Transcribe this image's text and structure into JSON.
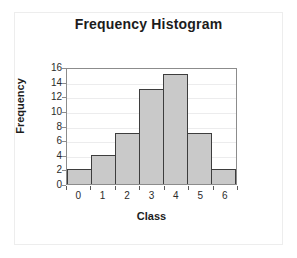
{
  "chart_data": {
    "type": "bar",
    "title": "Frequency Histogram",
    "xlabel": "Class",
    "ylabel": "Frequency",
    "categories": [
      "0",
      "1",
      "2",
      "3",
      "4",
      "5",
      "6"
    ],
    "values": [
      2,
      4,
      7,
      13,
      15,
      7,
      2
    ],
    "ylim": [
      0,
      16
    ],
    "yticks": [
      "16",
      "14",
      "12",
      "10",
      "8",
      "6",
      "4",
      "2",
      "0"
    ],
    "ytick_values": [
      16,
      14,
      12,
      10,
      8,
      6,
      4,
      2,
      0
    ],
    "grid": true,
    "legend": false,
    "bar_fill_color": "#c9c9c9",
    "bar_border_color": "#3d3d3d",
    "plot_border_color": "#8c8c8c",
    "gridline_color": "#ececed",
    "text_color": "#1c1c1c",
    "background_color": "#ffffff"
  }
}
